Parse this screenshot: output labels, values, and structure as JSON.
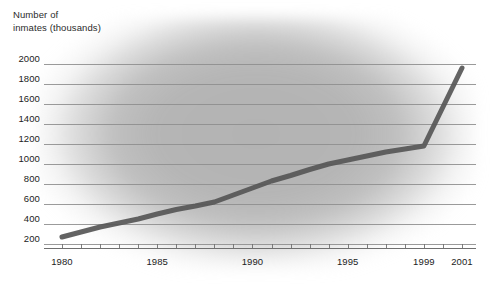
{
  "chart_data": {
    "type": "line",
    "title_line1": "Number of",
    "title_line2": "inmates (thousands)",
    "xlabel": "",
    "ylabel": "Number of inmates (thousands)",
    "xlim": [
      1979.4,
      2001.6
    ],
    "ylim": [
      150,
      2050
    ],
    "ytick_labels": [
      "2000",
      "1800",
      "1600",
      "1400",
      "1200",
      "1000",
      "800",
      "600",
      "400",
      "200"
    ],
    "ytick_values": [
      2000,
      1800,
      1600,
      1400,
      1200,
      1000,
      800,
      600,
      400,
      200
    ],
    "xtick_labels": [
      "1980",
      "1985",
      "1990",
      "1995",
      "1999",
      "2001"
    ],
    "xtick_values": [
      1980,
      1985,
      1990,
      1995,
      1999,
      2001
    ],
    "minor_xticks": [
      1980,
      1981,
      1982,
      1983,
      1984,
      1985,
      1986,
      1987,
      1988,
      1989,
      1990,
      1991,
      1992,
      1993,
      1994,
      1995,
      1996,
      1997,
      1998,
      1999,
      2000,
      2001
    ],
    "grid": "horizontal",
    "legend": "none",
    "x": [
      1980,
      1981,
      1982,
      1983,
      1984,
      1985,
      1986,
      1987,
      1988,
      1989,
      1990,
      1991,
      1992,
      1993,
      1994,
      1995,
      1996,
      1997,
      1998,
      1999,
      2000,
      2001
    ],
    "values": [
      270,
      320,
      370,
      410,
      450,
      500,
      545,
      580,
      620,
      690,
      760,
      830,
      885,
      945,
      1000,
      1040,
      1080,
      1120,
      1150,
      1180,
      1570,
      1960
    ],
    "series": [
      {
        "name": "Number of inmates (thousands)",
        "values": [
          270,
          320,
          370,
          410,
          450,
          500,
          545,
          580,
          620,
          690,
          760,
          830,
          885,
          945,
          1000,
          1040,
          1080,
          1120,
          1150,
          1180,
          1570,
          1960
        ]
      }
    ],
    "colors": {
      "line": "#575757",
      "gridline": "#8e8e8e",
      "axis": "#6f6f6f",
      "plot_background": "#b4b4b4",
      "page_background": "#ffffff",
      "text": "#222222"
    },
    "line_width_px": 5
  }
}
